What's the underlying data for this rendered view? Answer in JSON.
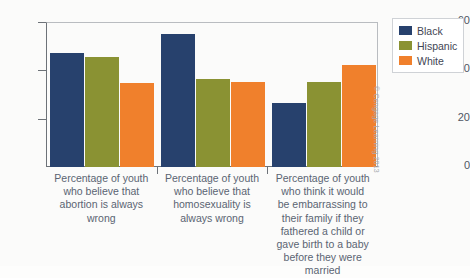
{
  "chart_data": {
    "type": "bar",
    "title": "",
    "subtitle": "",
    "xlabel": "",
    "ylabel": "",
    "ylim": [
      0,
      60
    ],
    "yticks": [
      0,
      20,
      40,
      60
    ],
    "grid": false,
    "legend_position": "top-right",
    "categories": [
      "Percentage of youth who believe that abortion is always wrong",
      "Percentage of youth who believe that homosexuality is always wrong",
      "Percentage of youth who think it would be embarrassing to their family if they fathered a child or gave birth to a baby before they were married"
    ],
    "category_lines": [
      [
        "Percentage of youth",
        "who believe that",
        "abortion is always",
        "wrong"
      ],
      [
        "Percentage of youth",
        "who believe that",
        "homosexuality is",
        "always wrong"
      ],
      [
        "Percentage of youth",
        "who think it would",
        "be embarrassing to",
        "their family if they",
        "fathered a child or",
        "gave birth to a baby",
        "before they were",
        "married"
      ]
    ],
    "series": [
      {
        "name": "Black",
        "color": "#27416d",
        "values": [
          47.5,
          55.5,
          26.5
        ]
      },
      {
        "name": "Hispanic",
        "color": "#8a9233",
        "values": [
          46.0,
          36.5,
          35.5
        ]
      },
      {
        "name": "White",
        "color": "#f0802c",
        "values": [
          35.0,
          35.5,
          42.5
        ]
      }
    ]
  },
  "legend": {
    "items": [
      {
        "label": "Black",
        "color": "#27416d"
      },
      {
        "label": "Hispanic",
        "color": "#8a9233"
      },
      {
        "label": "White",
        "color": "#f0802c"
      }
    ]
  },
  "credit": {
    "text": "© Cengage Learning 2013"
  }
}
